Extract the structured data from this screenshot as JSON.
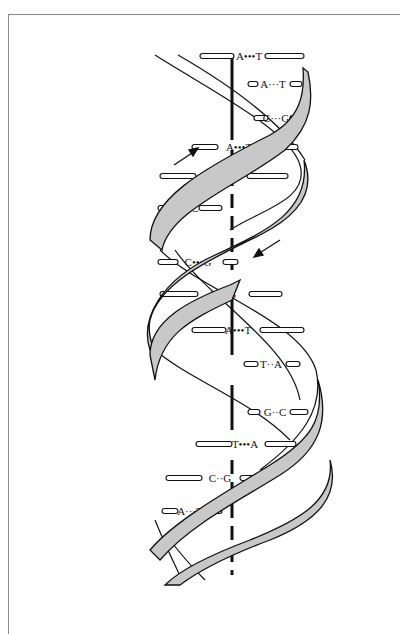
{
  "figure": {
    "strand_colors": {
      "ribbon": "#c8c8c8",
      "outline": "#111111",
      "background": "#ffffff"
    },
    "arrows": [
      {
        "name": "upper-strand-direction",
        "direction": "up-right"
      },
      {
        "name": "lower-strand-direction",
        "direction": "down-left"
      }
    ],
    "base_pairs": [
      {
        "left": "A",
        "bond": "•••",
        "right": "T"
      },
      {
        "left": "A",
        "bond": "···",
        "right": "T"
      },
      {
        "left": "C",
        "bond": "···",
        "right": "G"
      },
      {
        "left": "A",
        "bond": "•••",
        "right": "T"
      },
      {
        "left": "T",
        "bond": "•••",
        "right": "A"
      },
      {
        "left": "G",
        "bond": "··",
        "right": "C"
      },
      {
        "left": "C",
        "bond": "•••",
        "right": "G"
      },
      {
        "left": "C",
        "bond": "•••",
        "right": "G"
      },
      {
        "left": "A",
        "bond": "•••",
        "right": "T"
      },
      {
        "left": "T",
        "bond": "··",
        "right": "A"
      },
      {
        "left": "G",
        "bond": "··",
        "right": "C"
      },
      {
        "left": "T",
        "bond": "•••",
        "right": "A"
      },
      {
        "left": "C",
        "bond": "··",
        "right": "G"
      },
      {
        "left": "A",
        "bond": "···",
        "right": "T"
      }
    ]
  }
}
